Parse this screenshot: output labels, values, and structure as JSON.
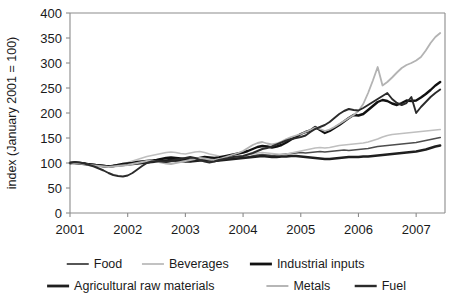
{
  "chart_data": {
    "type": "line",
    "title": "",
    "xlabel": "",
    "ylabel": "index (January 2001 = 100)",
    "ylim": [
      0,
      400
    ],
    "yticks": [
      0,
      50,
      100,
      150,
      200,
      250,
      300,
      350,
      400
    ],
    "ytick_labels": [
      "0",
      "50",
      "100",
      "150",
      "200",
      "250",
      "300",
      "350",
      "400"
    ],
    "xlim": [
      2001.0,
      2007.5
    ],
    "xticks": [
      2001,
      2002,
      2003,
      2004,
      2005,
      2006,
      2007
    ],
    "xtick_labels": [
      "2001",
      "2002",
      "2003",
      "2004",
      "2005",
      "2006",
      "2007"
    ],
    "grid": false,
    "legend_position": "bottom",
    "x": [
      2001.0,
      2001.083,
      2001.167,
      2001.25,
      2001.333,
      2001.417,
      2001.5,
      2001.583,
      2001.667,
      2001.75,
      2001.833,
      2001.917,
      2002.0,
      2002.083,
      2002.167,
      2002.25,
      2002.333,
      2002.417,
      2002.5,
      2002.583,
      2002.667,
      2002.75,
      2002.833,
      2002.917,
      2003.0,
      2003.083,
      2003.167,
      2003.25,
      2003.333,
      2003.417,
      2003.5,
      2003.583,
      2003.667,
      2003.75,
      2003.833,
      2003.917,
      2004.0,
      2004.083,
      2004.167,
      2004.25,
      2004.333,
      2004.417,
      2004.5,
      2004.583,
      2004.667,
      2004.75,
      2004.833,
      2004.917,
      2005.0,
      2005.083,
      2005.167,
      2005.25,
      2005.333,
      2005.417,
      2005.5,
      2005.583,
      2005.667,
      2005.75,
      2005.833,
      2005.917,
      2006.0,
      2006.083,
      2006.167,
      2006.25,
      2006.333,
      2006.417,
      2006.5,
      2006.583,
      2006.667,
      2006.75,
      2006.833,
      2006.917,
      2007.0,
      2007.083,
      2007.167,
      2007.25,
      2007.333,
      2007.417
    ],
    "series": [
      {
        "name": "Food",
        "color": "#4d4d4d",
        "width": 1.7,
        "values": [
          100,
          101,
          100,
          99,
          98,
          97,
          96,
          95,
          94,
          95,
          96,
          97,
          98,
          99,
          100,
          101,
          102,
          103,
          104,
          103,
          102,
          103,
          104,
          105,
          104,
          103,
          104,
          105,
          106,
          105,
          104,
          105,
          107,
          108,
          109,
          110,
          111,
          112,
          114,
          116,
          117,
          116,
          115,
          116,
          117,
          118,
          119,
          120,
          121,
          120,
          121,
          122,
          123,
          122,
          123,
          124,
          125,
          126,
          125,
          126,
          127,
          128,
          129,
          131,
          133,
          134,
          135,
          136,
          137,
          138,
          139,
          140,
          141,
          143,
          145,
          147,
          149,
          151
        ]
      },
      {
        "name": "Beverages",
        "color": "#bfbfbf",
        "width": 1.7,
        "values": [
          100,
          99,
          98,
          97,
          95,
          94,
          93,
          92,
          93,
          95,
          97,
          99,
          101,
          104,
          107,
          110,
          113,
          115,
          117,
          119,
          121,
          122,
          121,
          119,
          118,
          120,
          122,
          123,
          121,
          118,
          116,
          114,
          113,
          112,
          112,
          113,
          114,
          116,
          118,
          120,
          121,
          120,
          119,
          118,
          117,
          118,
          120,
          122,
          124,
          126,
          128,
          130,
          131,
          130,
          131,
          133,
          135,
          136,
          137,
          138,
          139,
          140,
          142,
          145,
          148,
          152,
          155,
          157,
          158,
          159,
          160,
          161,
          162,
          163,
          164,
          165,
          166,
          167
        ]
      },
      {
        "name": "Industrial inputs",
        "color": "#111111",
        "width": 2.4,
        "values": [
          100,
          101,
          100,
          99,
          97,
          96,
          95,
          94,
          93,
          94,
          96,
          98,
          99,
          100,
          102,
          103,
          104,
          105,
          106,
          108,
          110,
          111,
          110,
          109,
          108,
          107,
          108,
          110,
          112,
          111,
          110,
          111,
          113,
          115,
          117,
          119,
          121,
          124,
          128,
          132,
          134,
          133,
          131,
          133,
          136,
          141,
          147,
          152,
          158,
          162,
          165,
          172,
          166,
          160,
          164,
          170,
          176,
          183,
          190,
          196,
          195,
          198,
          206,
          214,
          222,
          226,
          224,
          219,
          216,
          220,
          225,
          224,
          225,
          231,
          238,
          246,
          255,
          262
        ]
      },
      {
        "name": "Agricultural raw materials",
        "color": "#1f1f1f",
        "width": 2.4,
        "values": [
          100,
          100,
          99,
          98,
          97,
          96,
          95,
          94,
          93,
          94,
          95,
          96,
          97,
          98,
          99,
          100,
          101,
          102,
          103,
          104,
          105,
          106,
          105,
          104,
          103,
          103,
          104,
          105,
          106,
          105,
          104,
          105,
          106,
          107,
          108,
          109,
          110,
          111,
          112,
          113,
          114,
          113,
          112,
          112,
          113,
          113,
          114,
          114,
          113,
          112,
          111,
          110,
          109,
          108,
          108,
          109,
          110,
          111,
          112,
          112,
          112,
          113,
          113,
          114,
          115,
          116,
          117,
          118,
          119,
          120,
          121,
          122,
          123,
          125,
          127,
          130,
          133,
          135
        ]
      },
      {
        "name": "Metals",
        "color": "#b3b3b3",
        "width": 1.8,
        "values": [
          100,
          100,
          99,
          98,
          96,
          95,
          94,
          93,
          92,
          93,
          94,
          95,
          96,
          98,
          100,
          102,
          104,
          105,
          103,
          101,
          99,
          98,
          100,
          102,
          104,
          106,
          108,
          110,
          109,
          107,
          106,
          108,
          111,
          114,
          117,
          120,
          124,
          130,
          136,
          140,
          142,
          139,
          137,
          139,
          143,
          148,
          152,
          155,
          158,
          162,
          166,
          171,
          168,
          164,
          167,
          172,
          178,
          184,
          190,
          196,
          204,
          218,
          240,
          265,
          292,
          255,
          262,
          271,
          281,
          290,
          296,
          300,
          305,
          312,
          325,
          340,
          352,
          360
        ]
      },
      {
        "name": "Fuel",
        "color": "#2b2b2b",
        "width": 1.9,
        "values": [
          100,
          102,
          101,
          99,
          96,
          93,
          89,
          85,
          80,
          76,
          74,
          73,
          75,
          80,
          87,
          94,
          100,
          103,
          104,
          103,
          102,
          104,
          107,
          108,
          110,
          112,
          110,
          106,
          103,
          101,
          103,
          106,
          108,
          110,
          112,
          113,
          114,
          117,
          120,
          124,
          128,
          130,
          133,
          137,
          141,
          145,
          148,
          150,
          152,
          155,
          162,
          168,
          172,
          176,
          182,
          190,
          198,
          204,
          208,
          206,
          205,
          210,
          216,
          222,
          228,
          234,
          240,
          228,
          220,
          216,
          220,
          232,
          200,
          212,
          222,
          232,
          240,
          247
        ]
      }
    ],
    "legend_rows": [
      [
        {
          "label": "Food",
          "color": "#4d4d4d",
          "width": 1.9
        },
        {
          "label": "Beverages",
          "color": "#bfbfbf",
          "width": 1.9
        },
        {
          "label": "Industrial inputs",
          "color": "#111111",
          "width": 2.8
        }
      ],
      [
        {
          "label": "Agricultural raw materials",
          "color": "#1f1f1f",
          "width": 2.8
        },
        {
          "label": "Metals",
          "color": "#b3b3b3",
          "width": 1.9
        },
        {
          "label": "Fuel",
          "color": "#2b2b2b",
          "width": 2.4
        }
      ]
    ]
  }
}
